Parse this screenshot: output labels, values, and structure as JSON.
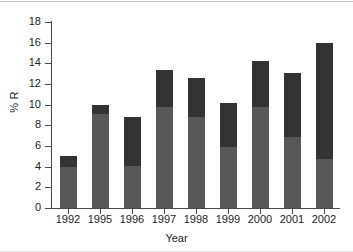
{
  "chart_data": {
    "type": "bar",
    "stacked": true,
    "title": "",
    "xlabel": "Year",
    "ylabel": "% R",
    "categories": [
      "1992",
      "1995",
      "1996",
      "1997",
      "1998",
      "1999",
      "2000",
      "2001",
      "2002"
    ],
    "series": [
      {
        "name": "lower-segment",
        "color": "#575757",
        "values": [
          4.0,
          9.1,
          4.1,
          9.8,
          8.8,
          5.9,
          9.8,
          6.9,
          4.7
        ]
      },
      {
        "name": "upper-segment",
        "color": "#333333",
        "values": [
          1.0,
          0.9,
          4.7,
          3.6,
          3.8,
          4.3,
          4.4,
          6.2,
          11.3
        ]
      }
    ],
    "totals": [
      5.0,
      10.0,
      8.8,
      13.4,
      12.6,
      10.2,
      14.2,
      13.1,
      16.0
    ],
    "ylim": [
      0,
      18
    ],
    "yticks": [
      0,
      2,
      4,
      6,
      8,
      10,
      12,
      14,
      16,
      18
    ],
    "ytick_labels": [
      "0",
      "2",
      "4",
      "6",
      "8",
      "10",
      "12",
      "14",
      "16",
      "18"
    ],
    "grid": false,
    "legend": false
  }
}
